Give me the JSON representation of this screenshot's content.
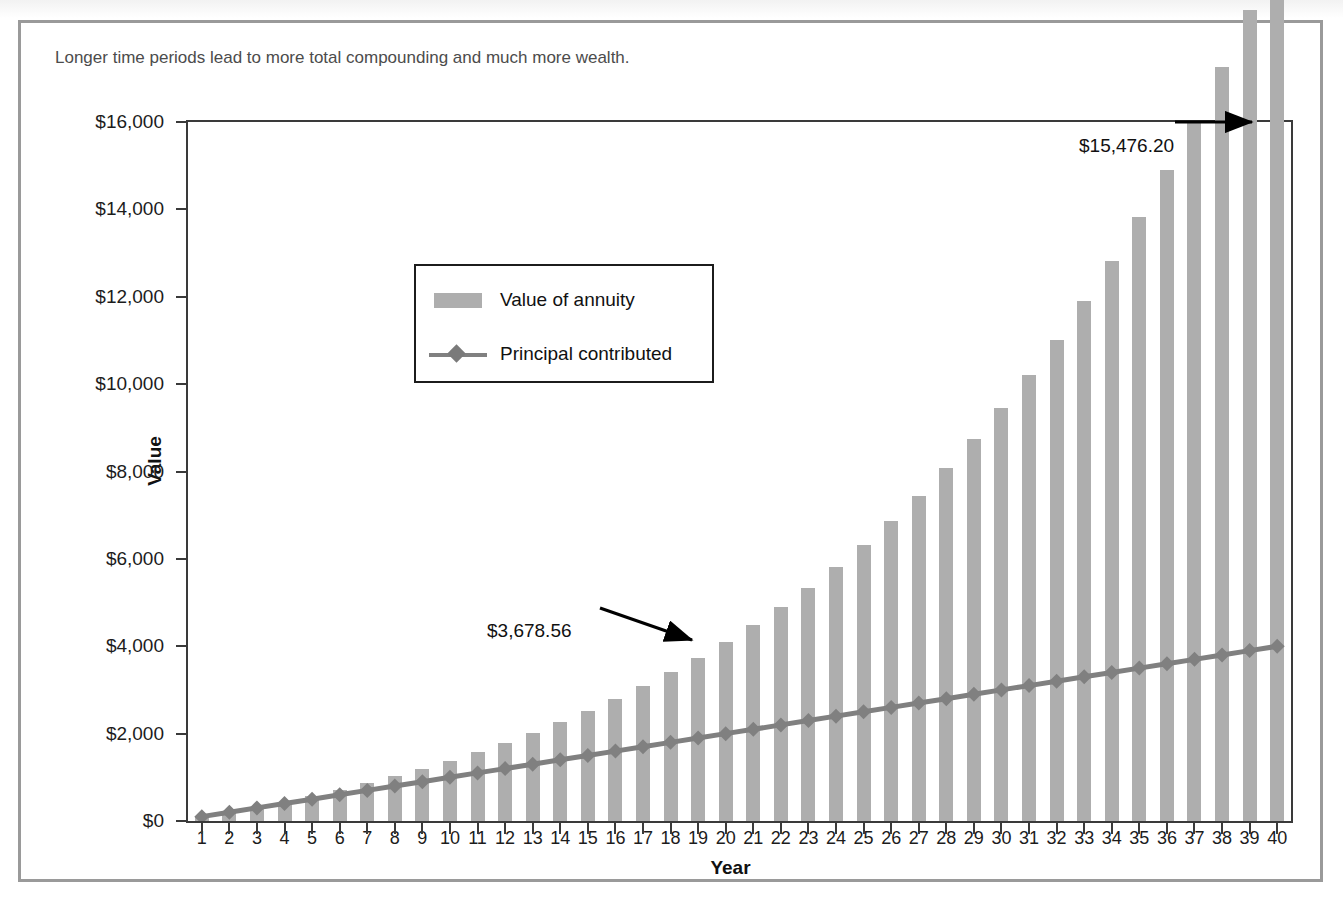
{
  "figure": {
    "subtitle": "Longer time periods lead to more total compounding and much more wealth."
  },
  "legend": {
    "position": "inside-upper-left",
    "items": [
      {
        "label": "Value of annuity",
        "marker": "bar-swatch",
        "color": "#aeaeae"
      },
      {
        "label": "Principal contributed",
        "marker": "line-diamond",
        "color": "#808080"
      }
    ]
  },
  "annotations": [
    {
      "name": "final-value",
      "text": "$15,476.20",
      "points_to_year": 40
    },
    {
      "name": "midpoint-value",
      "text": "$3,678.56",
      "points_to_year": 20
    }
  ],
  "colors": {
    "bar": "#aeaeae",
    "line": "#808080",
    "marker": "#7a7a7a",
    "axis": "#3a3a3a",
    "frame": "#9a9a9a",
    "text": "#1c1c1c"
  },
  "chart_data": {
    "type": "bar",
    "subtitle": "Longer time periods lead to more total compounding and much more wealth.",
    "xlabel": "Year",
    "ylabel": "Value",
    "ylim": [
      0,
      16000
    ],
    "ytick_labels": [
      "$0",
      "$2,000",
      "$4,000",
      "$6,000",
      "$8,000",
      "$10,000",
      "$12,000",
      "$14,000",
      "$16,000"
    ],
    "ytick_values": [
      0,
      2000,
      4000,
      6000,
      8000,
      10000,
      12000,
      14000,
      16000
    ],
    "grid": false,
    "legend_position": "upper left (inset box)",
    "categories": [
      1,
      2,
      3,
      4,
      5,
      6,
      7,
      8,
      9,
      10,
      11,
      12,
      13,
      14,
      15,
      16,
      17,
      18,
      19,
      20,
      21,
      22,
      23,
      24,
      25,
      26,
      27,
      28,
      29,
      30,
      31,
      32,
      33,
      34,
      35,
      36,
      37,
      38,
      39,
      40
    ],
    "series": [
      {
        "name": "Value of annuity",
        "type": "bar",
        "color": "#aeaeae",
        "values": [
          100.0,
          207.0,
          321.49,
          443.99,
          575.07,
          715.33,
          865.4,
          1025.98,
          1197.8,
          1381.64,
          1578.36,
          1788.85,
          2014.06,
          2255.05,
          2512.9,
          2788.7,
          3083.91,
          3399.78,
          3737.76,
          3678.56,
          4485.26,
          4899.23,
          5342.17,
          5816.12,
          6323.25,
          6865.87,
          7446.48,
          8067.74,
          8732.48,
          9443.76,
          10204.82,
          11019.16,
          11890.5,
          12822.84,
          13820.44,
          14887.87,
          12680.0,
          13560.0,
          14470.0,
          15476.2
        ]
      },
      {
        "name": "Principal contributed",
        "type": "line",
        "color": "#808080",
        "marker": "diamond",
        "values": [
          100,
          200,
          300,
          400,
          500,
          600,
          700,
          800,
          900,
          1000,
          1100,
          1200,
          1300,
          1400,
          1500,
          1600,
          1700,
          1800,
          1900,
          2000,
          2100,
          2200,
          2300,
          2400,
          2500,
          2600,
          2700,
          2800,
          2900,
          3000,
          3100,
          3200,
          3300,
          3400,
          3500,
          3600,
          3700,
          3800,
          3900,
          4000
        ]
      }
    ],
    "annotations": [
      {
        "text": "$3,678.56",
        "year": 20
      },
      {
        "text": "$15,476.20",
        "year": 40
      }
    ]
  }
}
